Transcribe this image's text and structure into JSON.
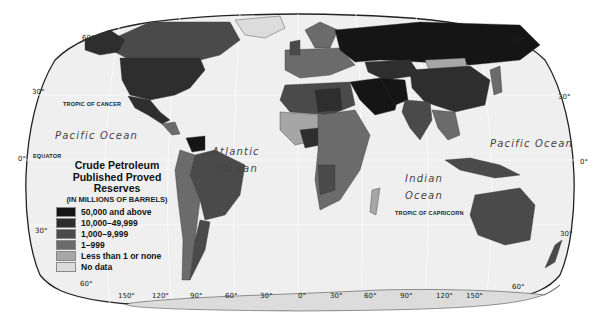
{
  "map": {
    "title": "Crude Petroleum",
    "title_line2": "Published Proved Reserves",
    "subtitle": "(IN MILLIONS OF BARRELS)",
    "legend": [
      {
        "label": "50,000 and above",
        "color": "#151515"
      },
      {
        "label": "10,000–49,999",
        "color": "#2e2e2e"
      },
      {
        "label": "1,000–9,999",
        "color": "#4a4a4a"
      },
      {
        "label": "1–999",
        "color": "#6b6b6b"
      },
      {
        "label": "Less than 1 or none",
        "color": "#a6a6a6"
      },
      {
        "label": "No data",
        "color": "#dcdcdc"
      }
    ],
    "oceans": {
      "pacific_west": "Pacific Ocean",
      "atlantic_1": "Atlantic",
      "atlantic_2": "Ocean",
      "indian_1": "Indian",
      "indian_2": "Ocean",
      "pacific_east": "Pacific Ocean"
    },
    "lines": {
      "tropic_cancer": "TROPIC OF CANCER",
      "equator": "EQUATOR",
      "tropic_capricorn": "TROPIC OF CAPRICORN"
    },
    "latitudes_left": [
      "60°",
      "30°",
      "0°",
      "30°",
      "60°"
    ],
    "latitudes_right": [
      "60°",
      "30°",
      "0°",
      "30°",
      "60°"
    ],
    "longitudes": [
      "150°",
      "120°",
      "90°",
      "60°",
      "30°",
      "0°",
      "30°",
      "60°",
      "90°",
      "120°",
      "150°"
    ],
    "colors": {
      "sea": "#efefef",
      "border": "#333333"
    }
  }
}
